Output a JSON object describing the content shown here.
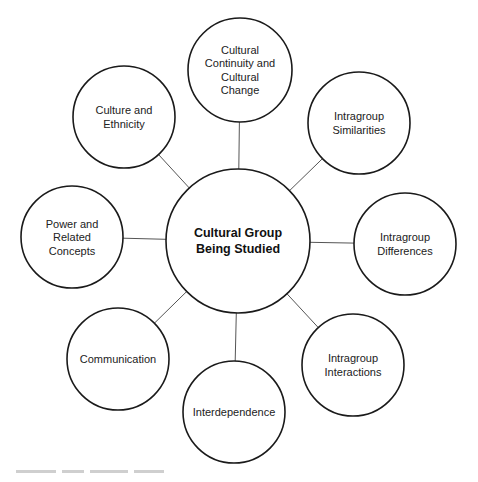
{
  "diagram": {
    "type": "hub-and-spoke",
    "center": {
      "id": "center",
      "lines": [
        "Cultural Group",
        "Being Studied"
      ],
      "cx": 238,
      "cy": 241,
      "r": 72
    },
    "satellites": [
      {
        "id": "cultural-continuity",
        "lines": [
          "Cultural",
          "Continuity and",
          "Cultural",
          "Change"
        ],
        "cx": 240,
        "cy": 70,
        "r": 52
      },
      {
        "id": "intragroup-similarities",
        "lines": [
          "Intragroup",
          "Similarities"
        ],
        "cx": 359,
        "cy": 123,
        "r": 51
      },
      {
        "id": "intragroup-differences",
        "lines": [
          "Intragroup",
          "Differences"
        ],
        "cx": 405,
        "cy": 244,
        "r": 51
      },
      {
        "id": "intragroup-interactions",
        "lines": [
          "Intragroup",
          "Interactions"
        ],
        "cx": 353,
        "cy": 365,
        "r": 51
      },
      {
        "id": "interdependence",
        "lines": [
          "Interdependence"
        ],
        "cx": 234,
        "cy": 412,
        "r": 51
      },
      {
        "id": "communication",
        "lines": [
          "Communication"
        ],
        "cx": 118,
        "cy": 359,
        "r": 51
      },
      {
        "id": "power-related-concepts",
        "lines": [
          "Power and",
          "Related",
          "Concepts"
        ],
        "cx": 72,
        "cy": 237,
        "r": 51
      },
      {
        "id": "culture-ethnicity",
        "lines": [
          "Culture and",
          "Ethnicity"
        ],
        "cx": 124,
        "cy": 117,
        "r": 51
      }
    ],
    "colors": {
      "stroke": "#1a1a1a",
      "connector": "#555555",
      "background": "#ffffff"
    }
  }
}
